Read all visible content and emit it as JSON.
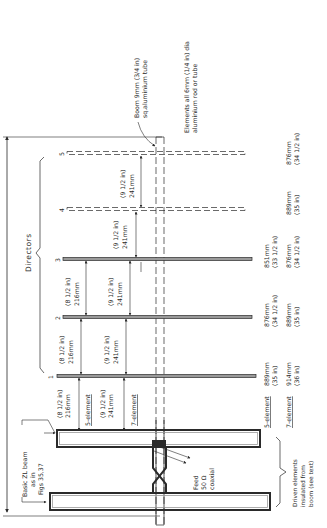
{
  "diagram": {
    "title_labels": {
      "boom": [
        "Boom 9mm (3/4 in)",
        "sq.aluminium tube"
      ],
      "elements": [
        "Elements all 6mm (1/4 in) dia",
        "aluminium rod or tube"
      ],
      "directors": "Directors",
      "basic_zl": [
        "Basic ZL beam",
        "as in",
        "Figs 35,37"
      ],
      "feed": [
        "Feed",
        "50 Ω",
        "coaxial"
      ],
      "driven": [
        "Driven elements",
        "insulated from",
        "boom (see text)"
      ],
      "five_element": "5-element",
      "seven_element": "7-element"
    },
    "elements": [
      {
        "number": "5",
        "style": "dashed",
        "length_7el": [
          "876mm",
          "(34 1/2 in)"
        ]
      },
      {
        "number": "4",
        "style": "dashed",
        "length_7el": [
          "889mm",
          "(35 in)"
        ]
      },
      {
        "number": "3",
        "style": "solid",
        "length_5el": [
          "851mm",
          "(33 1/2 in)"
        ],
        "length_7el": [
          "876mm",
          "(34 1/2 in)"
        ]
      },
      {
        "number": "2",
        "style": "solid",
        "length_5el": [
          "876mm",
          "(34 1/2 in)"
        ],
        "length_7el": [
          "889mm",
          "(35 in)"
        ]
      },
      {
        "number": "1",
        "style": "solid",
        "length_5el": [
          "889mm",
          "(35 in)"
        ],
        "length_7el": [
          "914mm",
          "(36 in)"
        ]
      }
    ],
    "spacings": {
      "five_element": [
        {
          "between": "driven-1",
          "mm": "216mm",
          "in": "(8 1/2 in)"
        },
        {
          "between": "1-2",
          "mm": "216mm",
          "in": "(8 1/2 in)"
        },
        {
          "between": "2-3",
          "mm": "216mm",
          "in": "(8 1/2 in)"
        }
      ],
      "seven_element": [
        {
          "between": "driven-1",
          "mm": "241mm",
          "in": "(9 1/2 in)"
        },
        {
          "between": "1-2",
          "mm": "241mm",
          "in": "(9 1/2 in)"
        },
        {
          "between": "2-3",
          "mm": "241mm",
          "in": "(9 1/2 in)"
        },
        {
          "between": "3-4",
          "mm": "241mm",
          "in": "(9 1/2 in)"
        },
        {
          "between": "4-5",
          "mm": "241mm",
          "in": "(9 1/2 in)"
        }
      ]
    },
    "colors": {
      "ink": "#2a2a2a",
      "element_fill": "#9a9a9a",
      "background": "#ffffff"
    }
  }
}
